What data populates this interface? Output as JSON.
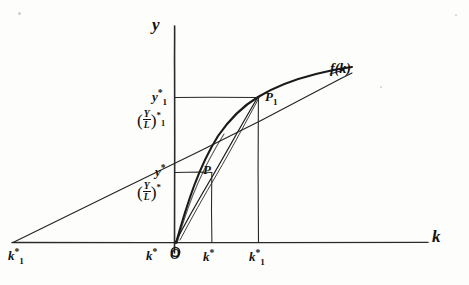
{
  "figure": {
    "kind": "hand-drawn-sketch",
    "ink_color": "#121212",
    "paper_color": "#fdfdfb"
  },
  "axes": {
    "y_axis_label": "y",
    "x_axis_label": "k",
    "origin_label": "O"
  },
  "curve": {
    "label_f": "f",
    "label_paren_open": "(",
    "label_arg": "k",
    "label_paren_close": ")",
    "full_label": "f(k)"
  },
  "points": [
    {
      "name": "P",
      "label": "P"
    },
    {
      "name": "P1",
      "label_base": "P",
      "label_sub": "1"
    }
  ],
  "y_ticks": [
    {
      "name": "y-star-1",
      "base": "y",
      "sup": "*",
      "sub": "1",
      "ratio_open": "(",
      "ratio_num": "Y",
      "ratio_den": "L",
      "ratio_close": ")",
      "ratio_sup": "*",
      "ratio_sub": "1"
    },
    {
      "name": "y-star",
      "base": "y",
      "sup": "*",
      "sub": "",
      "ratio_open": "(",
      "ratio_num": "Y",
      "ratio_den": "L",
      "ratio_close": ")",
      "ratio_sup": "*",
      "ratio_sub": ""
    }
  ],
  "x_ticks": [
    {
      "name": "k-star-1-left",
      "base": "k",
      "sup": "*",
      "sub": "1"
    },
    {
      "name": "k-star-negative",
      "base": "k",
      "sup": "*",
      "sub": ""
    },
    {
      "name": "k-star",
      "base": "k",
      "sup": "*",
      "sub": ""
    },
    {
      "name": "k-star-1-right",
      "base": "k",
      "sup": "*",
      "sub": "1"
    }
  ]
}
